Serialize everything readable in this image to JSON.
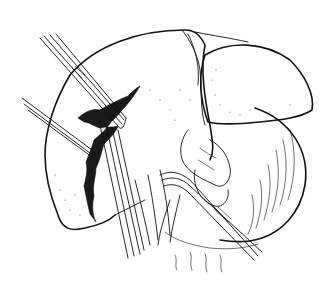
{
  "illustration": {
    "subject": "liver-resection-line-drawing",
    "colors": {
      "background": "#ffffff",
      "ink": "#111111"
    },
    "parts": [
      {
        "id": "liver-right-lobe",
        "label": ""
      },
      {
        "id": "liver-left-lobe",
        "label": ""
      },
      {
        "id": "stomach",
        "label": ""
      },
      {
        "id": "resection-line",
        "label": ""
      },
      {
        "id": "forceps-upper",
        "label": ""
      },
      {
        "id": "forceps-left",
        "label": ""
      },
      {
        "id": "forceps-lower-right",
        "label": ""
      },
      {
        "id": "hilar-vessels",
        "label": ""
      }
    ]
  }
}
